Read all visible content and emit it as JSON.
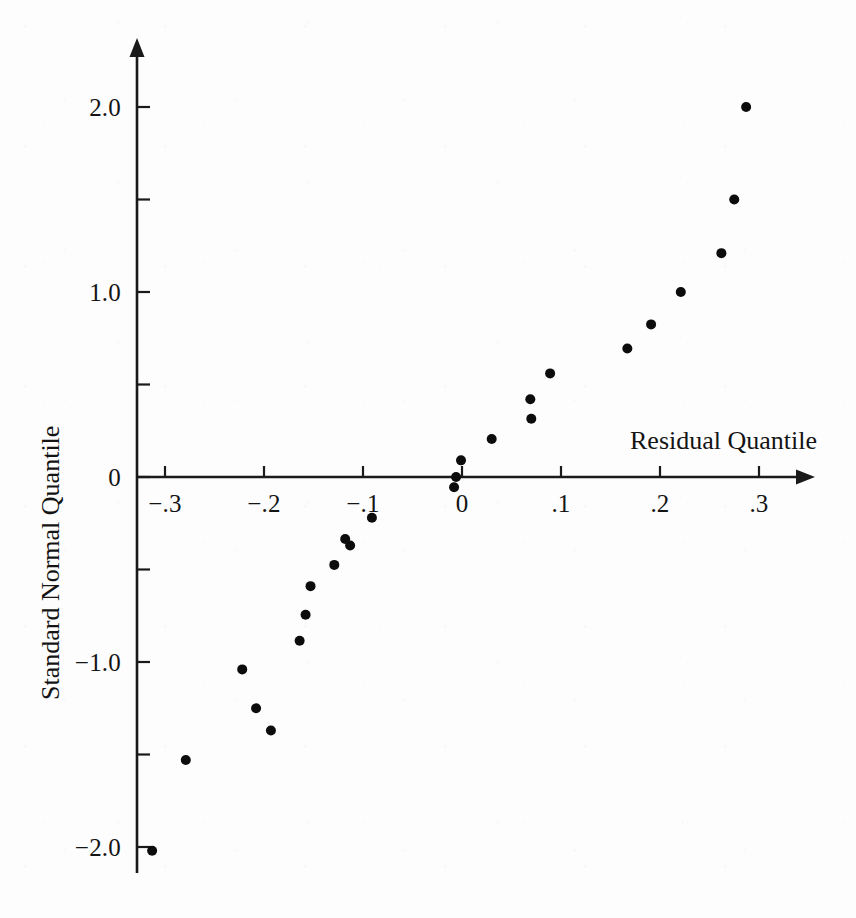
{
  "figure": {
    "width": 856,
    "height": 918,
    "background_color": "#fdfdfd",
    "ink_color": "#111111"
  },
  "chart_data": {
    "type": "scatter",
    "title": "",
    "subtitle": "",
    "xlabel": "Residual Quantile",
    "ylabel": "Standard Normal Quantile",
    "grid": false,
    "legend": null,
    "xlim": [
      -0.345,
      0.357
    ],
    "ylim": [
      -2.37,
      2.37
    ],
    "x_major_ticks": [
      -0.3,
      -0.2,
      -0.1,
      0,
      0.1,
      0.2,
      0.3
    ],
    "x_tick_labels": [
      "−.3",
      "−.2",
      "−.1",
      "0",
      ".1",
      ".2",
      ".3"
    ],
    "y_major_ticks": [
      -2.0,
      -1.0,
      0,
      1.0,
      2.0
    ],
    "y_tick_labels": [
      "−2.0",
      "−1.0",
      "0",
      "1.0",
      "2.0"
    ],
    "y_minor_ticks": [
      -1.5,
      -0.5,
      0.5,
      1.5
    ],
    "x_axis_position_y": 0,
    "y_axis_position_x": -0.345,
    "marker": "filled-circle",
    "marker_color": "#0c0c0c",
    "marker_radius_px": 5,
    "n_points": 25,
    "series": [
      {
        "name": "residual quantiles",
        "points": [
          [
            -0.313,
            -2.02
          ],
          [
            -0.279,
            -1.53
          ],
          [
            -0.208,
            -1.25
          ],
          [
            -0.222,
            -1.04
          ],
          [
            -0.164,
            -0.885
          ],
          [
            -0.158,
            -0.745
          ],
          [
            -0.153,
            -0.59
          ],
          [
            -0.129,
            -0.475
          ],
          [
            -0.113,
            -0.37
          ],
          [
            -0.118,
            -0.335
          ],
          [
            -0.091,
            -0.22
          ],
          [
            -0.008,
            -0.055
          ],
          [
            -0.006,
            0
          ],
          [
            -0.001,
            0.09
          ],
          [
            0.03,
            0.205
          ],
          [
            0.07,
            0.315
          ],
          [
            0.069,
            0.42
          ],
          [
            0.089,
            0.56
          ],
          [
            0.167,
            0.695
          ],
          [
            0.191,
            0.825
          ],
          [
            0.221,
            1.0
          ],
          [
            0.262,
            1.21
          ],
          [
            0.275,
            1.5
          ],
          [
            0.287,
            2.0
          ],
          [
            -0.193,
            -1.37
          ]
        ]
      }
    ]
  },
  "geometry": {
    "x_axis": {
      "y_px": 477,
      "x_start_px": 137,
      "x_end_px": 815
    },
    "y_axis": {
      "x_px": 137,
      "y_start_px": 38,
      "y_end_px": 873
    },
    "x_origin_px": 462,
    "y_origin_px": 477,
    "x_scale_px_per_unit": 990,
    "y_scale_px_per_unit": 185
  },
  "labels": {
    "x_title": "Residual Quantile",
    "y_title": "Standard Normal Quantile"
  }
}
